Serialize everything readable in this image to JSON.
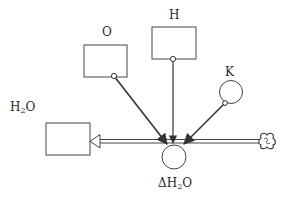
{
  "diagram": {
    "type": "stock-and-flow",
    "stroke_color": "#333333",
    "stocks": [
      {
        "id": "H2O",
        "label_main": "H",
        "label_sub": "2",
        "label_tail": "O"
      }
    ],
    "auxiliaries": [
      {
        "id": "O",
        "label": "O",
        "shape": "rectangle"
      },
      {
        "id": "H",
        "label": "H",
        "shape": "rectangle"
      },
      {
        "id": "K",
        "label": "K",
        "shape": "circle"
      }
    ],
    "flows": [
      {
        "id": "dH2O",
        "label_prefix": "ΔH",
        "label_sub": "2",
        "label_tail": "O",
        "from": "cloud-source",
        "to": "H2O"
      }
    ],
    "links": [
      {
        "from": "O",
        "to": "dH2O"
      },
      {
        "from": "H",
        "to": "dH2O"
      },
      {
        "from": "K",
        "to": "dH2O"
      }
    ],
    "source": {
      "id": "cloud-source",
      "icon": "cloud-icon"
    }
  }
}
